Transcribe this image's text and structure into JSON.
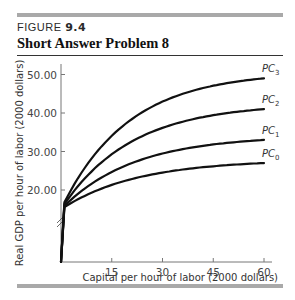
{
  "figure": {
    "label_prefix": "FIGURE ",
    "label_number": "9.4",
    "title": "Short Answer Problem 8"
  },
  "chart_data": {
    "type": "line",
    "title": "Short Answer Problem 8",
    "xlabel": "Capital per hour of labor (2000 dollars)",
    "ylabel": "Real GDP per hour of labor (2000 dollars)",
    "x_ticks": [
      15,
      30,
      45,
      60
    ],
    "y_ticks": [
      "20.00",
      "30.00",
      "40.00",
      "50.00"
    ],
    "xlim": [
      0,
      62
    ],
    "ylim": [
      15,
      52
    ],
    "y_axis_break": true,
    "grid": false,
    "series": [
      {
        "name": "PC0",
        "label_main": "PC",
        "label_sub": "0",
        "x": [
          0,
          5,
          15,
          30,
          45,
          60
        ],
        "values": [
          15,
          19,
          23,
          25.5,
          26.7,
          27
        ]
      },
      {
        "name": "PC1",
        "label_main": "PC",
        "label_sub": "1",
        "x": [
          0,
          5,
          15,
          30,
          45,
          60
        ],
        "values": [
          15,
          20,
          26,
          30,
          32.3,
          33
        ]
      },
      {
        "name": "PC2",
        "label_main": "PC",
        "label_sub": "2",
        "x": [
          0,
          5,
          15,
          30,
          45,
          60
        ],
        "values": [
          15,
          21,
          29,
          35,
          38.8,
          41
        ]
      },
      {
        "name": "PC3",
        "label_main": "PC",
        "label_sub": "3",
        "x": [
          0,
          5,
          15,
          30,
          45,
          60
        ],
        "values": [
          15,
          22,
          31.5,
          40,
          45.5,
          49
        ]
      }
    ]
  }
}
